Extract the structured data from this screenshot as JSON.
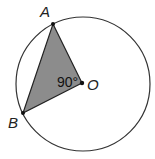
{
  "diagram": {
    "type": "circle-geometry",
    "points": {
      "A": {
        "label": "A"
      },
      "B": {
        "label": "B"
      },
      "O": {
        "label": "O"
      }
    },
    "angle_label": "90°",
    "colors": {
      "triangle_fill": "#8c8c8c",
      "stroke": "#222222",
      "background": "#ffffff"
    }
  }
}
